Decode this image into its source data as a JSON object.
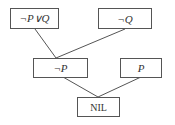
{
  "diagram": {
    "type": "resolution-refutation-tree",
    "nodes": [
      {
        "id": "n1",
        "label": "¬P∨Q"
      },
      {
        "id": "n2",
        "label": "¬Q"
      },
      {
        "id": "n3",
        "label": "¬P"
      },
      {
        "id": "n4",
        "label": "P"
      },
      {
        "id": "n5",
        "label": "NIL"
      }
    ],
    "edges": [
      {
        "from": "n1",
        "to": "n3"
      },
      {
        "from": "n2",
        "to": "n3"
      },
      {
        "from": "n3",
        "to": "n5"
      },
      {
        "from": "n4",
        "to": "n5"
      }
    ],
    "colors": {
      "stroke": "#555555",
      "text": "#333333",
      "background": "#ffffff"
    }
  }
}
